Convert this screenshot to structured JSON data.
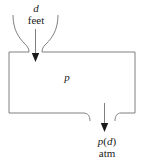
{
  "figure": {
    "type": "pressure-vessel-diagram",
    "stroke_color": "#808080",
    "text_color": "#1a1a1a",
    "background_color": "#ffffff"
  },
  "inlet": {
    "variable_label": "d",
    "units_label": "feet",
    "arrow_direction": "down",
    "icon": "down-arrow-icon"
  },
  "vessel": {
    "interior_label": "p",
    "shape": "tank-outline"
  },
  "outlet": {
    "function_label_prefix": "p",
    "function_label_open": "(",
    "function_label_variable": "d",
    "function_label_close": ")",
    "function_label": "p(d)",
    "units_label": "atm",
    "arrow_direction": "down",
    "icon": "down-arrow-icon"
  }
}
